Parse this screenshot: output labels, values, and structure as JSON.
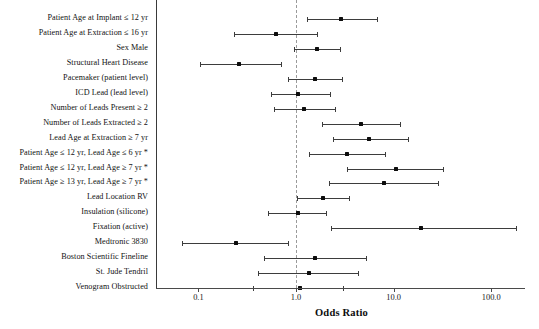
{
  "chart_data": {
    "type": "forest",
    "title": "",
    "xlabel": "Odds Ratio",
    "ylabel": "",
    "xscale": "log",
    "xlim": [
      0.055,
      420
    ],
    "grid": false,
    "legend": "none",
    "null_line": 1.0,
    "xticks": [
      "0.1",
      "1.0",
      "10.0",
      "100.0"
    ],
    "xtick_values": [
      0.1,
      1.0,
      10.0,
      100.0
    ],
    "categories": [
      "Patient Age at Implant ≤ 12 yr",
      "Patient Age at Extraction ≤ 16 yr",
      "Sex Male",
      "Structural Heart Disease",
      "Pacemaker (patient level)",
      "ICD Lead (lead level)",
      "Number of Leads Present ≥ 2",
      "Number of Leads Extracted ≥ 2",
      "Lead Age at Extraction ≥ 7 yr",
      "Patient Age ≤ 12 yr, Lead Age ≤ 6 yr *",
      "Patient Age ≤ 12 yr, Lead Age ≥ 7 yr *",
      "Patient Age ≥ 13 yr, Lead Age ≥ 7 yr *",
      "Lead Location RV",
      "Insulation (silicone)",
      "Fixation (active)",
      "Medtronic 3830",
      "Boston Scientific Fineline",
      "St. Jude Tendril",
      "Venogram Obstructed"
    ],
    "points": [
      {
        "label": "Patient Age at Implant ≤ 12 yr",
        "or": 2.9,
        "lo": 1.3,
        "hi": 7.0
      },
      {
        "label": "Patient Age at Extraction ≤ 16 yr",
        "or": 0.62,
        "lo": 0.23,
        "hi": 1.7
      },
      {
        "label": "Sex Male",
        "or": 1.65,
        "lo": 0.95,
        "hi": 2.9
      },
      {
        "label": "Structural Heart Disease",
        "or": 0.26,
        "lo": 0.105,
        "hi": 0.72
      },
      {
        "label": "Pacemaker (patient level)",
        "or": 1.55,
        "lo": 0.83,
        "hi": 3.0
      },
      {
        "label": "ICD Lead (lead level)",
        "or": 1.05,
        "lo": 0.56,
        "hi": 2.3
      },
      {
        "label": "Number of Leads Present ≥ 2",
        "or": 1.2,
        "lo": 0.6,
        "hi": 2.6
      },
      {
        "label": "Number of Leads Extracted ≥ 2",
        "or": 4.6,
        "lo": 1.85,
        "hi": 12.0
      },
      {
        "label": "Lead Age at Extraction ≥ 7 yr",
        "or": 5.6,
        "lo": 2.4,
        "hi": 14.5
      },
      {
        "label": "Patient Age ≤ 12 yr, Lead Age ≤ 6 yr *",
        "or": 3.3,
        "lo": 1.35,
        "hi": 8.4
      },
      {
        "label": "Patient Age ≤ 12 yr, Lead Age ≥ 7 yr *",
        "or": 10.5,
        "lo": 3.3,
        "hi": 33.0
      },
      {
        "label": "Patient Age ≥ 13 yr, Lead Age ≥ 7 yr *",
        "or": 8.0,
        "lo": 2.2,
        "hi": 29.0
      },
      {
        "label": "Lead Location RV",
        "or": 1.9,
        "lo": 1.02,
        "hi": 3.55
      },
      {
        "label": "Insulation (silicone)",
        "or": 1.05,
        "lo": 0.52,
        "hi": 2.1
      },
      {
        "label": "Fixation (active)",
        "or": 19.0,
        "lo": 2.3,
        "hi": 185.0
      },
      {
        "label": "Medtronic 3830",
        "or": 0.24,
        "lo": 0.068,
        "hi": 0.85
      },
      {
        "label": "Boston Scientific Fineline",
        "or": 1.55,
        "lo": 0.47,
        "hi": 5.4
      },
      {
        "label": "St. Jude Tendril",
        "or": 1.35,
        "lo": 0.41,
        "hi": 4.4
      },
      {
        "label": "Venogram Obstructed",
        "or": 1.1,
        "lo": 0.36,
        "hi": 3.1
      }
    ]
  },
  "axis": {
    "xlabel": "Odds Ratio",
    "ticks": [
      {
        "text": "0.1",
        "value": 0.1
      },
      {
        "text": "1.0",
        "value": 1.0
      },
      {
        "text": "10.0",
        "value": 10.0
      },
      {
        "text": "100.0",
        "value": 100.0
      }
    ]
  },
  "colors": {
    "marker": "#0d0d0d",
    "line": "#3d3d3d",
    "axis": "#4a4a4a",
    "null_line": "#9a9a9a",
    "text": "#121212",
    "background": "#ffffff"
  }
}
